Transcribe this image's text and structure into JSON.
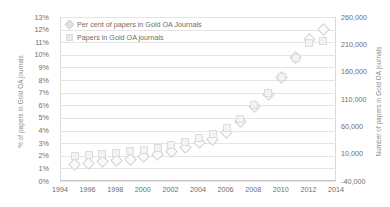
{
  "chart_data": {
    "type": "scatter",
    "title": "",
    "xlabel": "",
    "ylabel": "% of papers in Gold OA journals",
    "y2label": "Number of papers in Gold OA journals",
    "grid": true,
    "legend_position": "top-left",
    "xlim": [
      1994,
      2014
    ],
    "xticks": [
      "1994",
      "1996",
      "1998",
      "2000",
      "2002",
      "2004",
      "2006",
      "2008",
      "2010",
      "2012",
      "2014"
    ],
    "ylim": [
      0,
      13
    ],
    "yticks": [
      "0%",
      "1%",
      "2%",
      "3%",
      "4%",
      "5%",
      "6%",
      "7%",
      "8%",
      "9%",
      "10%",
      "11%",
      "12%",
      "13%"
    ],
    "y2lim": [
      -40000,
      260000
    ],
    "y2ticks": [
      "-40,000",
      "10,000",
      "60,000",
      "110,000",
      "160,000",
      "210,000",
      "260,000"
    ],
    "x": [
      1995,
      1996,
      1997,
      1998,
      1999,
      2000,
      2001,
      2002,
      2003,
      2004,
      2005,
      2006,
      2007,
      2008,
      2009,
      2010,
      2011,
      2012,
      2013
    ],
    "series": [
      {
        "name": "Per cent of papers in Gold OA Journals",
        "axis": "left",
        "marker": "diamond",
        "color": "#cfcfd4",
        "values": [
          1.4,
          1.5,
          1.6,
          1.7,
          1.8,
          2.0,
          2.2,
          2.4,
          2.7,
          3.1,
          3.4,
          3.9,
          4.8,
          6.0,
          6.9,
          8.3,
          9.9,
          11.3,
          12.1
        ]
      },
      {
        "name": "Papers in Gold OA journals",
        "axis": "right",
        "marker": "square",
        "color": "#dcdcdf",
        "values": [
          7000,
          9000,
          11000,
          13000,
          16000,
          19000,
          23000,
          27000,
          33000,
          40000,
          48000,
          58000,
          76000,
          100000,
          122000,
          152000,
          187000,
          215000,
          218000
        ]
      }
    ]
  }
}
